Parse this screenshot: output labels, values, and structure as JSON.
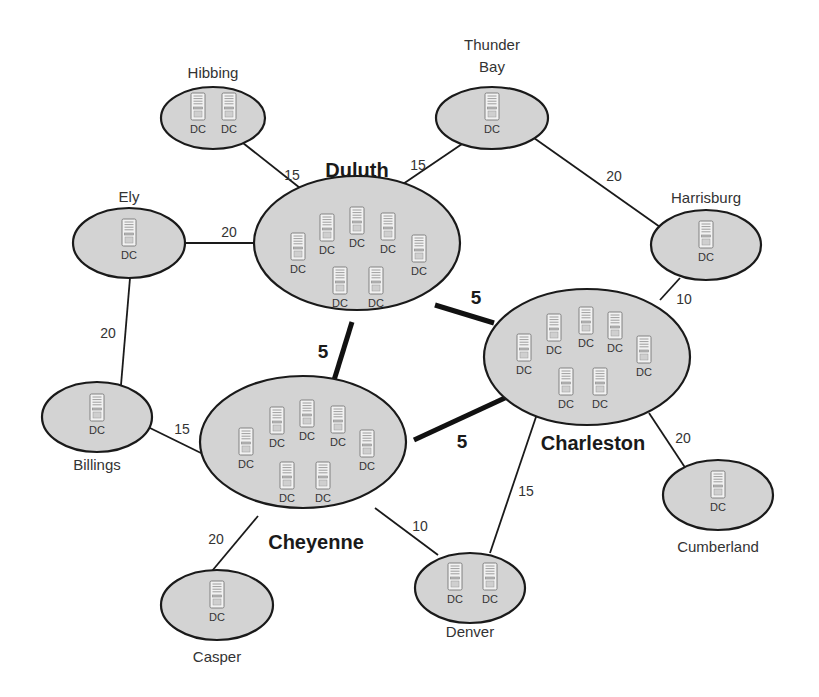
{
  "diagram": {
    "server_label": "DC",
    "server_icon": "server-tower-icon",
    "colors": {
      "site_fill": "#d3d3d3",
      "site_stroke": "#1a1a1a",
      "link": "#1a1a1a",
      "text": "#333333"
    }
  },
  "sites": [
    {
      "id": "hibbing",
      "name": "Hibbing",
      "hub": false,
      "dc_count": 2,
      "cx": 213,
      "cy": 118,
      "rx": 52,
      "ry": 31,
      "label_lines": [
        "Hibbing"
      ],
      "label_x": 213,
      "label_y": 78,
      "dcs": [
        [
          198,
          115
        ],
        [
          229,
          115
        ]
      ]
    },
    {
      "id": "thunder-bay",
      "name": "Thunder Bay",
      "hub": false,
      "dc_count": 1,
      "cx": 492,
      "cy": 118,
      "rx": 56,
      "ry": 31,
      "label_lines": [
        "Thunder",
        "Bay"
      ],
      "label_x": 492,
      "label_y": 50,
      "dcs": [
        [
          492,
          115
        ]
      ]
    },
    {
      "id": "duluth",
      "name": "Duluth",
      "hub": true,
      "dc_count": 8,
      "cx": 357,
      "cy": 243,
      "rx": 103,
      "ry": 67,
      "label_lines": [
        "Duluth"
      ],
      "label_x": 357,
      "label_y": 177,
      "dcs": [
        [
          298,
          255
        ],
        [
          327,
          236
        ],
        [
          357,
          229
        ],
        [
          388,
          235
        ],
        [
          419,
          257
        ],
        [
          340,
          289
        ],
        [
          376,
          289
        ]
      ]
    },
    {
      "id": "ely",
      "name": "Ely",
      "hub": false,
      "dc_count": 1,
      "cx": 129,
      "cy": 243,
      "rx": 56,
      "ry": 35,
      "label_lines": [
        "Ely"
      ],
      "label_x": 129,
      "label_y": 202,
      "dcs": [
        [
          129,
          241
        ]
      ]
    },
    {
      "id": "harrisburg",
      "name": "Harrisburg",
      "hub": false,
      "dc_count": 1,
      "cx": 706,
      "cy": 245,
      "rx": 55,
      "ry": 35,
      "label_lines": [
        "Harrisburg"
      ],
      "label_x": 706,
      "label_y": 203,
      "dcs": [
        [
          706,
          243
        ]
      ]
    },
    {
      "id": "charleston",
      "name": "Charleston",
      "hub": true,
      "dc_count": 8,
      "cx": 587,
      "cy": 357,
      "rx": 103,
      "ry": 68,
      "label_lines": [
        "Charleston"
      ],
      "label_x": 593,
      "label_y": 450,
      "dcs": [
        [
          524,
          356
        ],
        [
          554,
          336
        ],
        [
          586,
          329
        ],
        [
          615,
          334
        ],
        [
          644,
          358
        ],
        [
          566,
          390
        ],
        [
          600,
          390
        ]
      ]
    },
    {
      "id": "billings",
      "name": "Billings",
      "hub": false,
      "dc_count": 1,
      "cx": 97,
      "cy": 417,
      "rx": 55,
      "ry": 35,
      "label_lines": [
        "Billings"
      ],
      "label_x": 97,
      "label_y": 470,
      "dcs": [
        [
          97,
          416
        ]
      ]
    },
    {
      "id": "cheyenne",
      "name": "Cheyenne",
      "hub": true,
      "dc_count": 8,
      "cx": 303,
      "cy": 442,
      "rx": 103,
      "ry": 66,
      "label_lines": [
        "Cheyenne"
      ],
      "label_x": 316,
      "label_y": 549,
      "dcs": [
        [
          246,
          450
        ],
        [
          277,
          429
        ],
        [
          307,
          422
        ],
        [
          338,
          428
        ],
        [
          367,
          452
        ],
        [
          287,
          484
        ],
        [
          323,
          484
        ]
      ]
    },
    {
      "id": "casper",
      "name": "Casper",
      "hub": false,
      "dc_count": 1,
      "cx": 217,
      "cy": 605,
      "rx": 56,
      "ry": 35,
      "label_lines": [
        "Casper"
      ],
      "label_x": 217,
      "label_y": 662,
      "dcs": [
        [
          217,
          603
        ]
      ]
    },
    {
      "id": "denver",
      "name": "Denver",
      "hub": false,
      "dc_count": 2,
      "cx": 470,
      "cy": 588,
      "rx": 55,
      "ry": 35,
      "label_lines": [
        "Denver"
      ],
      "label_x": 470,
      "label_y": 637,
      "dcs": [
        [
          455,
          585
        ],
        [
          490,
          585
        ]
      ]
    },
    {
      "id": "cumberland",
      "name": "Cumberland",
      "hub": false,
      "dc_count": 1,
      "cx": 718,
      "cy": 495,
      "rx": 55,
      "ry": 35,
      "label_lines": [
        "Cumberland"
      ],
      "label_x": 718,
      "label_y": 552,
      "dcs": [
        [
          718,
          493
        ]
      ]
    }
  ],
  "links": [
    {
      "from": "Hibbing",
      "to": "Duluth",
      "cost": 15,
      "thick": false,
      "x1": 243,
      "y1": 143,
      "x2": 300,
      "y2": 188,
      "label_x": 292,
      "label_y": 180
    },
    {
      "from": "Thunder Bay",
      "to": "Duluth",
      "cost": 15,
      "thick": false,
      "x1": 462,
      "y1": 144,
      "x2": 403,
      "y2": 184,
      "label_x": 418,
      "label_y": 170
    },
    {
      "from": "Thunder Bay",
      "to": "Harrisburg",
      "cost": 20,
      "thick": false,
      "x1": 534,
      "y1": 138,
      "x2": 660,
      "y2": 227,
      "label_x": 614,
      "label_y": 181
    },
    {
      "from": "Ely",
      "to": "Duluth",
      "cost": 20,
      "thick": false,
      "x1": 185,
      "y1": 243,
      "x2": 255,
      "y2": 243,
      "label_x": 229,
      "label_y": 237
    },
    {
      "from": "Ely",
      "to": "Billings",
      "cost": 20,
      "thick": false,
      "x1": 130,
      "y1": 278,
      "x2": 121,
      "y2": 385,
      "label_x": 108,
      "label_y": 338
    },
    {
      "from": "Harrisburg",
      "to": "Charleston",
      "cost": 10,
      "thick": false,
      "x1": 680,
      "y1": 278,
      "x2": 660,
      "y2": 300,
      "label_x": 684,
      "label_y": 304
    },
    {
      "from": "Duluth",
      "to": "Charleston",
      "cost": 5,
      "thick": true,
      "x1": 435,
      "y1": 305,
      "x2": 494,
      "y2": 323,
      "label_x": 476,
      "label_y": 304
    },
    {
      "from": "Duluth",
      "to": "Cheyenne",
      "cost": 5,
      "thick": true,
      "x1": 352,
      "y1": 322,
      "x2": 331,
      "y2": 390,
      "label_x": 323,
      "label_y": 358
    },
    {
      "from": "Cheyenne",
      "to": "Charleston",
      "cost": 5,
      "thick": true,
      "x1": 414,
      "y1": 440,
      "x2": 507,
      "y2": 397,
      "label_x": 462,
      "label_y": 448
    },
    {
      "from": "Billings",
      "to": "Cheyenne",
      "cost": 15,
      "thick": false,
      "x1": 150,
      "y1": 428,
      "x2": 205,
      "y2": 455,
      "label_x": 182,
      "label_y": 434
    },
    {
      "from": "Cheyenne",
      "to": "Casper",
      "cost": 20,
      "thick": false,
      "x1": 258,
      "y1": 516,
      "x2": 212,
      "y2": 571,
      "label_x": 216,
      "label_y": 544
    },
    {
      "from": "Cheyenne",
      "to": "Denver",
      "cost": 10,
      "thick": false,
      "x1": 375,
      "y1": 508,
      "x2": 438,
      "y2": 555,
      "label_x": 420,
      "label_y": 531
    },
    {
      "from": "Charleston",
      "to": "Denver",
      "cost": 15,
      "thick": false,
      "x1": 537,
      "y1": 414,
      "x2": 490,
      "y2": 553,
      "label_x": 526,
      "label_y": 496
    },
    {
      "from": "Charleston",
      "to": "Cumberland",
      "cost": 20,
      "thick": false,
      "x1": 649,
      "y1": 413,
      "x2": 686,
      "y2": 469,
      "label_x": 683,
      "label_y": 443
    }
  ]
}
